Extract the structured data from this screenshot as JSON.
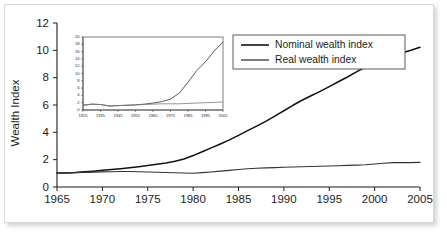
{
  "figure": {
    "axis_color": "#1c1c1c",
    "series_nominal_color": "#111111",
    "series_real_color": "#333333",
    "card_background": "#ffffff",
    "card_border": "#d8d8d8"
  },
  "legend": {
    "position": "top-right",
    "entries": [
      {
        "label": "Nominal wealth index",
        "color": "#111111"
      },
      {
        "label": "Real wealth index",
        "color": "#333333"
      }
    ]
  },
  "chart_data": {
    "type": "line",
    "title": "",
    "xlabel": "",
    "ylabel": "Wealth Index",
    "xlim": [
      1965,
      2005
    ],
    "ylim": [
      0,
      12
    ],
    "xticks": [
      1965,
      1970,
      1975,
      1980,
      1985,
      1990,
      1995,
      2000,
      2005
    ],
    "xtick_labels": [
      "1965",
      "1970",
      "1975",
      "1980",
      "1985",
      "1990",
      "1995",
      "2000",
      "2005"
    ],
    "yticks": [
      0,
      2,
      4,
      6,
      8,
      10,
      12
    ],
    "ytick_labels": [
      "0",
      "2",
      "4",
      "6",
      "8",
      "10",
      "12"
    ],
    "grid": false,
    "legend_position": "upper right",
    "x": [
      1965,
      1966,
      1967,
      1968,
      1969,
      1970,
      1971,
      1972,
      1973,
      1974,
      1975,
      1976,
      1977,
      1978,
      1979,
      1980,
      1981,
      1982,
      1983,
      1984,
      1985,
      1986,
      1987,
      1988,
      1989,
      1990,
      1991,
      1992,
      1993,
      1994,
      1995,
      1996,
      1997,
      1998,
      1999,
      2000,
      2001,
      2002,
      2003,
      2004,
      2005
    ],
    "series": [
      {
        "name": "Nominal wealth index",
        "color": "#111111",
        "values": [
          1.02,
          1.03,
          1.06,
          1.11,
          1.16,
          1.22,
          1.28,
          1.34,
          1.41,
          1.49,
          1.57,
          1.66,
          1.76,
          1.88,
          2.05,
          2.3,
          2.58,
          2.86,
          3.15,
          3.45,
          3.78,
          4.12,
          4.45,
          4.8,
          5.18,
          5.58,
          5.98,
          6.35,
          6.68,
          7.0,
          7.35,
          7.7,
          8.05,
          8.42,
          8.78,
          9.12,
          9.45,
          9.62,
          9.8,
          10.0,
          10.22
        ]
      },
      {
        "name": "Real wealth index",
        "color": "#333333",
        "values": [
          1.02,
          1.03,
          1.05,
          1.07,
          1.09,
          1.11,
          1.12,
          1.13,
          1.13,
          1.12,
          1.1,
          1.08,
          1.06,
          1.04,
          1.02,
          1.01,
          1.05,
          1.1,
          1.16,
          1.22,
          1.28,
          1.33,
          1.37,
          1.4,
          1.42,
          1.44,
          1.46,
          1.48,
          1.5,
          1.52,
          1.54,
          1.56,
          1.58,
          1.6,
          1.63,
          1.68,
          1.74,
          1.78,
          1.78,
          1.78,
          1.8
        ]
      }
    ]
  },
  "inset_chart_data": {
    "type": "line",
    "title": "",
    "xlabel": "",
    "ylabel": "",
    "xlim": [
      1925,
      2005
    ],
    "ylim": [
      0,
      20
    ],
    "xticks": [
      1925,
      1935,
      1945,
      1955,
      1965,
      1975,
      1985,
      1995,
      2005
    ],
    "xtick_labels": [
      "1925",
      "1935",
      "1945",
      "1955",
      "1965",
      "1975",
      "1985",
      "1995",
      "2005"
    ],
    "yticks": [
      0,
      2,
      4,
      6,
      8,
      10,
      12,
      14,
      16,
      18,
      20
    ],
    "ytick_labels": [
      "0",
      "2",
      "4",
      "6",
      "8",
      "10",
      "12",
      "14",
      "16",
      "18",
      "20"
    ],
    "grid": false,
    "x": [
      1925,
      1930,
      1935,
      1940,
      1945,
      1950,
      1955,
      1960,
      1965,
      1970,
      1975,
      1980,
      1985,
      1990,
      1995,
      2000,
      2005
    ],
    "series": [
      {
        "name": "Nominal wealth index",
        "color": "#3a3a3a",
        "values": [
          1.3,
          1.6,
          1.5,
          1.1,
          1.2,
          1.3,
          1.4,
          1.6,
          1.9,
          2.3,
          3.0,
          4.6,
          7.6,
          10.8,
          13.2,
          16.2,
          18.6
        ]
      },
      {
        "name": "Real wealth index",
        "color": "#7a7a7a",
        "values": [
          1.3,
          1.6,
          1.5,
          1.1,
          1.2,
          1.3,
          1.4,
          1.5,
          1.6,
          1.7,
          1.7,
          1.7,
          1.8,
          1.9,
          2.0,
          2.1,
          2.2
        ]
      }
    ]
  }
}
